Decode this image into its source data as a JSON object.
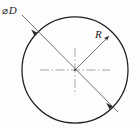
{
  "drawing": {
    "title": "Circle with diameter and radius dimensions",
    "canvas": {
      "width": 140,
      "height": 129,
      "background": "#fdfdfd"
    },
    "colors": {
      "outline": "#1a1a1a",
      "leader": "#555555",
      "centerline": "#999999",
      "text": "#1a1a1a"
    },
    "labels": {
      "diameter_symbol": "⌀",
      "diameter_value": "D",
      "radius_value": "R"
    },
    "circle": {
      "center_x": 75,
      "center_y": 70,
      "radius": 53
    },
    "diameter_leader": {
      "start_x": 22,
      "start_y": 15,
      "end_x": 118,
      "end_y": 112,
      "arrow1_x": 38,
      "arrow1_y": 33,
      "arrow2_x": 112,
      "arrow2_y": 106
    },
    "radius_leader": {
      "start_x": 75,
      "start_y": 70,
      "end_x": 113,
      "end_y": 32
    },
    "centerlines": {
      "horizontal_x1": 40,
      "horizontal_x2": 110,
      "vertical_y1": 48,
      "vertical_y2": 95
    }
  }
}
